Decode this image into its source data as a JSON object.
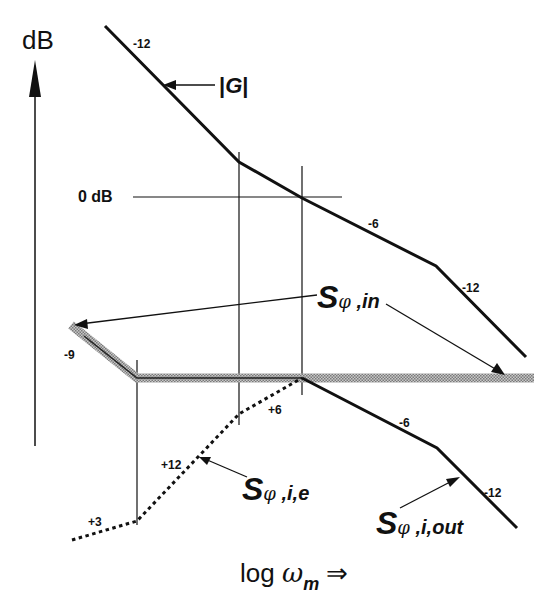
{
  "axes": {
    "y_label": "dB",
    "x_label_prefix": "log ",
    "x_label_symbol": "ω",
    "x_label_subscript": "m",
    "x_label_arrow": "⇒",
    "zero_line_label": "0 dB"
  },
  "curves": {
    "G": {
      "label_prefix": "|",
      "label_name": "G",
      "label_suffix": "|",
      "slopes": [
        "-12",
        "-6",
        "-12"
      ]
    },
    "S_phi_in": {
      "symbol": "S",
      "phi": "φ",
      "subscript": " ,in",
      "slopes": [
        "-9"
      ]
    },
    "S_phi_i_e": {
      "symbol": "S",
      "phi": "φ",
      "subscript": " ,i,e",
      "slopes": [
        "+3",
        "+12",
        "+6"
      ]
    },
    "S_phi_i_out": {
      "symbol": "S",
      "phi": "φ",
      "subscript": " ,i,out",
      "slopes": [
        "-6",
        "-12"
      ]
    }
  },
  "colors": {
    "line": "#111111",
    "hatched_band": "#9a9a9a",
    "background": "#ffffff"
  }
}
